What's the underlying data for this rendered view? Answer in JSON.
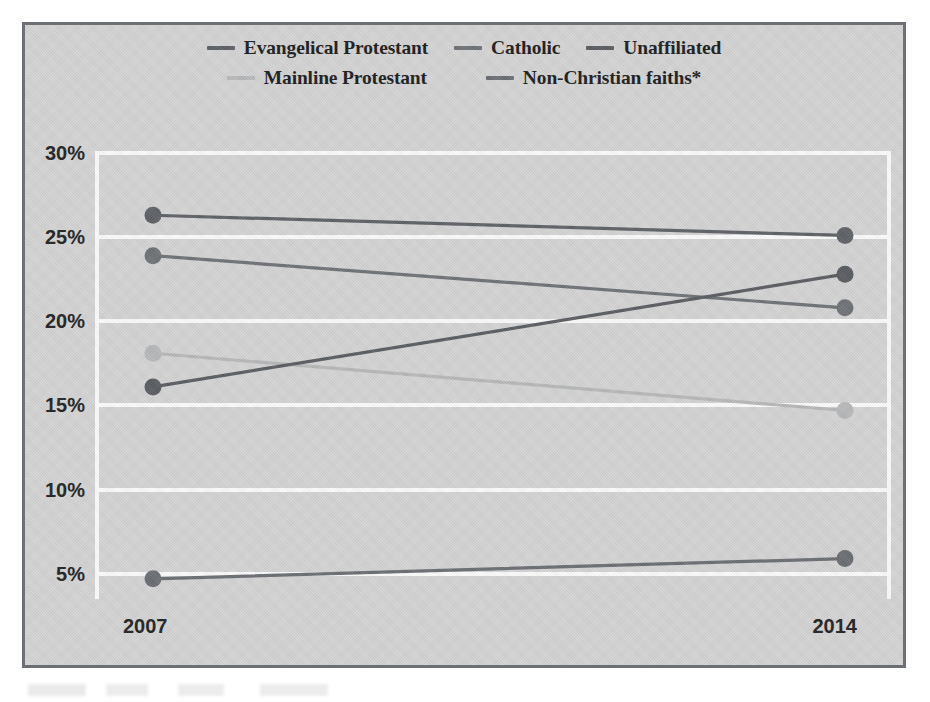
{
  "legend": {
    "rows": [
      [
        {
          "label": "Evangelical Protestant",
          "color": "#5e6166"
        },
        {
          "label": "Catholic",
          "color": "#6f7276"
        },
        {
          "label": "Unaffiliated",
          "color": "#5a5d62"
        }
      ],
      [
        {
          "label": "Mainline Protestant",
          "color": "#b6b8ba"
        },
        {
          "label": "Non-Christian faiths*",
          "color": "#6b6e73"
        }
      ]
    ]
  },
  "axes": {
    "y_ticks": [
      "30%",
      "25%",
      "20%",
      "15%",
      "10%",
      "5%"
    ],
    "y_tick_values": [
      30,
      25,
      20,
      15,
      10,
      5
    ],
    "x_ticks": [
      "2007",
      "2014"
    ]
  },
  "chart_data": {
    "type": "line",
    "subtype": "slope-chart",
    "title": "",
    "subtitle": "",
    "xlabel": "",
    "ylabel": "",
    "x": [
      "2007",
      "2014"
    ],
    "categories": [
      "2007",
      "2014"
    ],
    "ylim": [
      3.5,
      30
    ],
    "ytick_values": [
      30,
      25,
      20,
      15,
      10,
      5
    ],
    "ytick_labels": [
      "30%",
      "25%",
      "20%",
      "15%",
      "10%",
      "5%"
    ],
    "grid": "horizontal-white-gridlines",
    "legend_position": "top-center",
    "value_suffix": "%",
    "footnote": "*",
    "series": [
      {
        "name": "Evangelical Protestant",
        "values": [
          26.3,
          25.1
        ],
        "color": "#5e6166"
      },
      {
        "name": "Catholic",
        "values": [
          23.9,
          20.8
        ],
        "color": "#6f7276"
      },
      {
        "name": "Mainline Protestant",
        "values": [
          18.1,
          14.7
        ],
        "color": "#b6b8ba"
      },
      {
        "name": "Unaffiliated",
        "values": [
          16.1,
          22.8
        ],
        "color": "#5a5d62"
      },
      {
        "name": "Non-Christian faiths*",
        "values": [
          4.7,
          5.9
        ],
        "color": "#6b6e73"
      }
    ]
  },
  "style": {
    "frame_border": "#6d7074",
    "card_background": "#d4d4d4",
    "gridline_color": "#fbfbfb",
    "text_color": "#1d1d1d"
  }
}
